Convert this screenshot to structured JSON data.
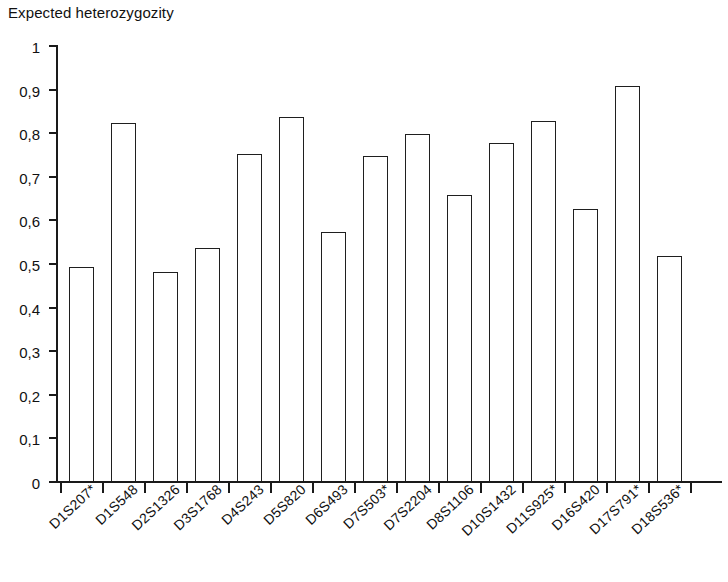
{
  "chart_data": {
    "type": "bar",
    "title": "Expected heterozygozity",
    "xlabel": "",
    "ylabel": "",
    "ylim": [
      0,
      1
    ],
    "grid": false,
    "legend": null,
    "decimal_separator": ",",
    "ytick_labels": [
      "1",
      "0,9",
      "0,8",
      "0,7",
      "0,6",
      "0,5",
      "0,4",
      "0,3",
      "0,2",
      "0,1",
      "0"
    ],
    "ytick_values": [
      1,
      0.9,
      0.8,
      0.7,
      0.6,
      0.5,
      0.4,
      0.3,
      0.2,
      0.1,
      0
    ],
    "categories": [
      "D1S207*",
      "D1S548",
      "D2S1326",
      "D3S1768",
      "D4S243",
      "D5S820",
      "D6S493",
      "D7S503*",
      "D7S2204",
      "D8S1106",
      "D10S1432",
      "D11S925*",
      "D16S420",
      "D17S791*",
      "D18S536*"
    ],
    "values": [
      0.49,
      0.82,
      0.48,
      0.535,
      0.75,
      0.835,
      0.57,
      0.745,
      0.795,
      0.655,
      0.775,
      0.825,
      0.625,
      0.905,
      0.515
    ],
    "bar_style": {
      "fill": "#ffffff",
      "edge": "#1f1f1f",
      "edge_width_px": 1.6
    }
  }
}
